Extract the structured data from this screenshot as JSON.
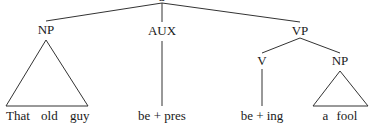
{
  "diagram": {
    "type": "syntax-tree",
    "root": {
      "label": "S"
    },
    "nodes": {
      "np_subject": {
        "label": "NP"
      },
      "aux": {
        "label": "AUX"
      },
      "vp": {
        "label": "VP"
      },
      "v": {
        "label": "V"
      },
      "np_object": {
        "label": "NP"
      }
    },
    "leaves": {
      "subject_words": [
        "That",
        "old",
        "guy"
      ],
      "aux_text": "be + pres",
      "v_text": "be + ing",
      "object_words": [
        "a",
        "fool"
      ]
    },
    "colors": {
      "line": "#333333",
      "text": "#1a1a1a",
      "background": "#ffffff"
    }
  }
}
